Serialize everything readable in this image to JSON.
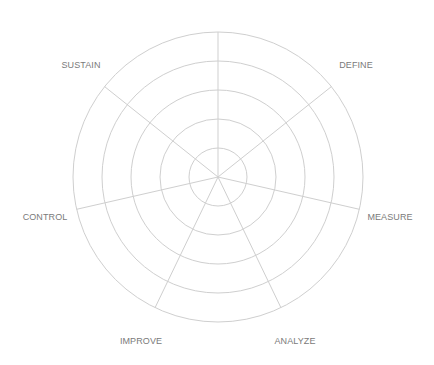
{
  "diagram": {
    "type": "polar-wheel",
    "center": [
      218,
      177
    ],
    "rings": [
      29,
      58,
      87,
      116,
      145
    ],
    "spoke_count": 7,
    "line_color": "#cfcfcf",
    "label_color": "#7a7a7a",
    "labels": [
      {
        "text": "DEFINE",
        "x": 356,
        "y": 68
      },
      {
        "text": "MEASURE",
        "x": 390,
        "y": 220
      },
      {
        "text": "ANALYZE",
        "x": 295,
        "y": 344
      },
      {
        "text": "IMPROVE",
        "x": 141,
        "y": 344
      },
      {
        "text": "CONTROL",
        "x": 45,
        "y": 220
      },
      {
        "text": "SUSTAIN",
        "x": 81,
        "y": 68
      }
    ]
  }
}
